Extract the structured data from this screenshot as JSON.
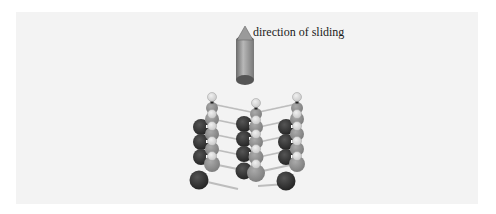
{
  "figure": {
    "caption": "direction of sliding",
    "arrow": {
      "direction": "up",
      "icon": "arrow-up-cylinder-icon"
    },
    "lattice": {
      "columns": 3,
      "layers_per_column": 4,
      "atom_types": [
        {
          "name": "dark",
          "color": "#333333"
        },
        {
          "name": "medium",
          "color": "#8f8f8f"
        },
        {
          "name": "light",
          "color": "#dcdcdc"
        }
      ]
    },
    "colors": {
      "panel_background": "#f3f3f3",
      "arrow_body": "#a0a0a0",
      "arrow_dark": "#555555"
    }
  }
}
